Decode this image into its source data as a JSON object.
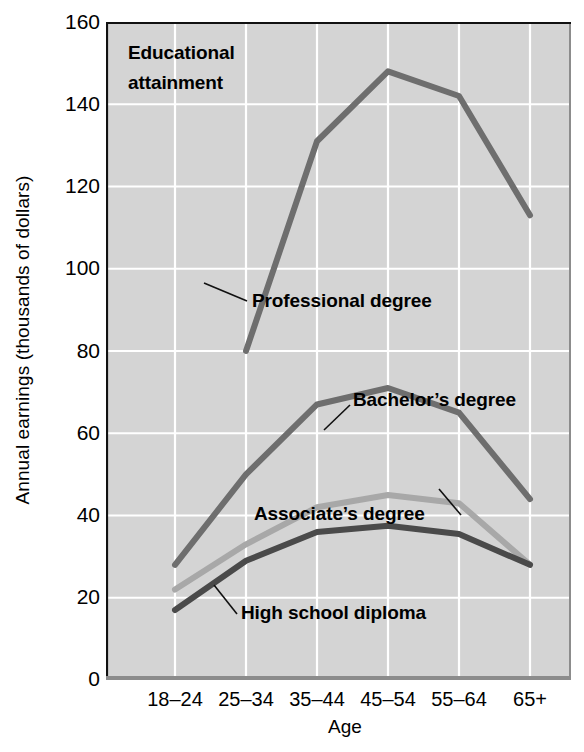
{
  "chart_data": {
    "type": "line",
    "title": "Educational attainment",
    "xlabel": "Age",
    "ylabel": "Annual earnings (thousands of dollars)",
    "categories": [
      "18–24",
      "25–34",
      "35–44",
      "45–54",
      "55–64",
      "65+"
    ],
    "ylim": [
      0,
      160
    ],
    "yticks": [
      0,
      20,
      40,
      60,
      80,
      100,
      120,
      140,
      160
    ],
    "grid": true,
    "legend_position": "inline-annotations",
    "series": [
      {
        "name": "Professional degree",
        "color": "#6e6e6e",
        "values": [
          null,
          80,
          131,
          148,
          142,
          113
        ]
      },
      {
        "name": "Bachelor's degree",
        "color": "#6e6e6e",
        "values": [
          28,
          50,
          67,
          71,
          65,
          44
        ]
      },
      {
        "name": "Associate's degree",
        "color": "#a8a8a8",
        "values": [
          22,
          33,
          42,
          45,
          43,
          28
        ]
      },
      {
        "name": "High school diploma",
        "color": "#4a4a4a",
        "values": [
          17,
          29,
          36,
          37.5,
          35.5,
          28
        ]
      }
    ]
  },
  "annotations": {
    "title_line1": "Educational",
    "title_line2": "attainment",
    "professional": "Professional degree",
    "bachelors": "Bachelor’s degree",
    "associates": "Associate’s degree",
    "highschool": "High school diploma"
  },
  "yticklabels": [
    "160",
    "140",
    "120",
    "100",
    "80",
    "60",
    "40",
    "20",
    "0"
  ],
  "colors": {
    "plot_background": "#d4d4d4",
    "grid": "#ffffff",
    "axis": "#000000",
    "professional_degree": "#6e6e6e",
    "bachelors_degree": "#6e6e6e",
    "associates_degree": "#a8a8a8",
    "high_school_diploma": "#4a4a4a",
    "text": "#000000"
  }
}
